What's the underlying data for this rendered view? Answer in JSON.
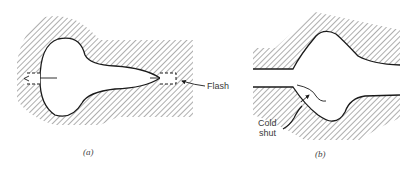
{
  "figure": {
    "panels": [
      {
        "id": "a",
        "caption": "(a)",
        "description": "Closed-die forging cavity with flash gutters at both ends",
        "labels": [
          {
            "text": "Flash",
            "points_to": "right flash gutter"
          }
        ]
      },
      {
        "id": "b",
        "caption": "(b)",
        "description": "Upper and lower die halves with forging defect",
        "labels": [
          {
            "text": "Cold",
            "line": 1
          },
          {
            "text": "shut",
            "line": 2
          }
        ]
      }
    ],
    "colors": {
      "ink": "#1a1a1a",
      "hatch": "#6a6a6a",
      "background": "#ffffff"
    }
  }
}
